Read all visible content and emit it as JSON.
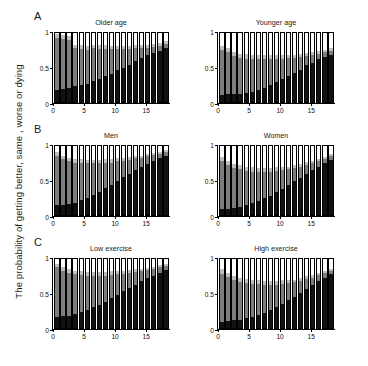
{
  "figure": {
    "ylabel": "The probability of getting better, same , worse or dying",
    "panels": [
      {
        "letter": "A",
        "left_title": "Older age",
        "right_title": "Younger age"
      },
      {
        "letter": "B",
        "left_title": "Men",
        "right_title": "Women"
      },
      {
        "letter": "C",
        "left_title": "Low exercise",
        "right_title": "High exercise"
      }
    ]
  },
  "colors": {
    "dying": "#111111",
    "worse": "#7d7d7d",
    "same": "#bfbfbf",
    "better": "#ffffff",
    "axis": "#000000",
    "background": "#ffffff"
  },
  "chart_data": [
    {
      "type": "bar",
      "title": "Older age",
      "panel": "A",
      "position": "left",
      "stacked": true,
      "xlabel": "",
      "ylabel": "The probability of getting better, same , worse or dying",
      "xlim": [
        0,
        19
      ],
      "ylim": [
        0,
        1
      ],
      "yticks": [
        0,
        0.5,
        1
      ],
      "ytick_labels": [
        "0",
        "0.5",
        "1"
      ],
      "xticks": [
        0,
        5,
        10,
        15
      ],
      "xtick_labels": [
        "0",
        "5",
        "10",
        "15"
      ],
      "grid": false,
      "legend": "none",
      "categories": [
        1,
        2,
        3,
        4,
        5,
        6,
        7,
        8,
        9,
        10,
        11,
        12,
        13,
        14,
        15,
        16,
        17,
        18,
        19
      ],
      "series": [
        {
          "name": "dying",
          "values": [
            0.18,
            0.19,
            0.2,
            0.23,
            0.25,
            0.26,
            0.3,
            0.33,
            0.37,
            0.41,
            0.46,
            0.5,
            0.53,
            0.6,
            0.64,
            0.68,
            0.71,
            0.74,
            0.78
          ]
        },
        {
          "name": "worse",
          "values": [
            0.75,
            0.73,
            0.7,
            0.55,
            0.52,
            0.5,
            0.48,
            0.44,
            0.4,
            0.36,
            0.31,
            0.27,
            0.24,
            0.18,
            0.14,
            0.11,
            0.09,
            0.07,
            0.06
          ]
        },
        {
          "name": "same",
          "values": [
            0.05,
            0.05,
            0.05,
            0.05,
            0.05,
            0.05,
            0.05,
            0.05,
            0.05,
            0.04,
            0.04,
            0.04,
            0.04,
            0.04,
            0.04,
            0.04,
            0.04,
            0.04,
            0.04
          ]
        },
        {
          "name": "better",
          "values": [
            0.02,
            0.03,
            0.05,
            0.17,
            0.18,
            0.19,
            0.17,
            0.18,
            0.18,
            0.19,
            0.19,
            0.19,
            0.19,
            0.18,
            0.18,
            0.17,
            0.16,
            0.15,
            0.12
          ]
        }
      ]
    },
    {
      "type": "bar",
      "title": "Younger age",
      "panel": "A",
      "position": "right",
      "stacked": true,
      "xlim": [
        0,
        19
      ],
      "ylim": [
        0,
        1
      ],
      "yticks": [
        0,
        0.5,
        1
      ],
      "ytick_labels": [
        "0",
        "0.5",
        "1"
      ],
      "xticks": [
        0,
        5,
        10,
        15
      ],
      "xtick_labels": [
        "0",
        "5",
        "10",
        "15"
      ],
      "grid": false,
      "legend": "none",
      "categories": [
        1,
        2,
        3,
        4,
        5,
        6,
        7,
        8,
        9,
        10,
        11,
        12,
        13,
        14,
        15,
        16,
        17,
        18,
        19
      ],
      "series": [
        {
          "name": "dying",
          "values": [
            0.1,
            0.11,
            0.12,
            0.12,
            0.13,
            0.15,
            0.18,
            0.21,
            0.25,
            0.29,
            0.33,
            0.38,
            0.42,
            0.47,
            0.53,
            0.57,
            0.62,
            0.65,
            0.68
          ]
        },
        {
          "name": "worse",
          "values": [
            0.66,
            0.62,
            0.55,
            0.52,
            0.5,
            0.48,
            0.45,
            0.42,
            0.38,
            0.34,
            0.3,
            0.26,
            0.22,
            0.18,
            0.14,
            0.11,
            0.08,
            0.07,
            0.06
          ]
        },
        {
          "name": "same",
          "values": [
            0.05,
            0.06,
            0.06,
            0.06,
            0.06,
            0.05,
            0.05,
            0.05,
            0.05,
            0.05,
            0.05,
            0.04,
            0.04,
            0.04,
            0.04,
            0.04,
            0.04,
            0.04,
            0.04
          ]
        },
        {
          "name": "better",
          "values": [
            0.19,
            0.21,
            0.27,
            0.3,
            0.31,
            0.32,
            0.32,
            0.32,
            0.32,
            0.32,
            0.32,
            0.32,
            0.32,
            0.31,
            0.29,
            0.28,
            0.26,
            0.24,
            0.22
          ]
        }
      ]
    },
    {
      "type": "bar",
      "title": "Men",
      "panel": "B",
      "position": "left",
      "stacked": true,
      "xlim": [
        0,
        19
      ],
      "ylim": [
        0,
        1
      ],
      "yticks": [
        0,
        0.5,
        1
      ],
      "ytick_labels": [
        "0",
        "0.5",
        "1"
      ],
      "xticks": [
        0,
        5,
        10,
        15
      ],
      "xtick_labels": [
        "0",
        "5",
        "10",
        "15"
      ],
      "grid": false,
      "legend": "none",
      "categories": [
        1,
        2,
        3,
        4,
        5,
        6,
        7,
        8,
        9,
        10,
        11,
        12,
        13,
        14,
        15,
        16,
        17,
        18,
        19
      ],
      "series": [
        {
          "name": "dying",
          "values": [
            0.14,
            0.15,
            0.16,
            0.18,
            0.22,
            0.25,
            0.29,
            0.34,
            0.39,
            0.44,
            0.5,
            0.55,
            0.6,
            0.65,
            0.7,
            0.74,
            0.78,
            0.82,
            0.86
          ]
        },
        {
          "name": "worse",
          "values": [
            0.72,
            0.66,
            0.62,
            0.58,
            0.54,
            0.5,
            0.46,
            0.41,
            0.37,
            0.32,
            0.28,
            0.24,
            0.2,
            0.17,
            0.13,
            0.11,
            0.09,
            0.07,
            0.05
          ]
        },
        {
          "name": "same",
          "values": [
            0.05,
            0.05,
            0.05,
            0.05,
            0.05,
            0.05,
            0.05,
            0.05,
            0.05,
            0.05,
            0.04,
            0.04,
            0.04,
            0.03,
            0.03,
            0.03,
            0.03,
            0.03,
            0.03
          ]
        },
        {
          "name": "better",
          "values": [
            0.09,
            0.14,
            0.17,
            0.19,
            0.19,
            0.2,
            0.2,
            0.2,
            0.19,
            0.19,
            0.18,
            0.17,
            0.16,
            0.15,
            0.14,
            0.12,
            0.1,
            0.08,
            0.06
          ]
        }
      ]
    },
    {
      "type": "bar",
      "title": "Women",
      "panel": "B",
      "position": "right",
      "stacked": true,
      "xlim": [
        0,
        19
      ],
      "ylim": [
        0,
        1
      ],
      "yticks": [
        0,
        0.5,
        1
      ],
      "ytick_labels": [
        "0",
        "0.5",
        "1"
      ],
      "xticks": [
        0,
        5,
        10,
        15
      ],
      "xtick_labels": [
        "0",
        "5",
        "10",
        "15"
      ],
      "grid": false,
      "legend": "none",
      "categories": [
        1,
        2,
        3,
        4,
        5,
        6,
        7,
        8,
        9,
        10,
        11,
        12,
        13,
        14,
        15,
        16,
        17,
        18,
        19
      ],
      "series": [
        {
          "name": "dying",
          "values": [
            0.08,
            0.09,
            0.1,
            0.12,
            0.14,
            0.17,
            0.2,
            0.24,
            0.28,
            0.33,
            0.38,
            0.43,
            0.49,
            0.54,
            0.6,
            0.65,
            0.7,
            0.75,
            0.8
          ]
        },
        {
          "name": "worse",
          "values": [
            0.7,
            0.63,
            0.58,
            0.54,
            0.5,
            0.46,
            0.43,
            0.39,
            0.35,
            0.31,
            0.27,
            0.23,
            0.19,
            0.16,
            0.13,
            0.1,
            0.08,
            0.06,
            0.05
          ]
        },
        {
          "name": "same",
          "values": [
            0.06,
            0.06,
            0.06,
            0.06,
            0.06,
            0.06,
            0.05,
            0.05,
            0.05,
            0.05,
            0.05,
            0.04,
            0.04,
            0.04,
            0.04,
            0.03,
            0.03,
            0.03,
            0.03
          ]
        },
        {
          "name": "better",
          "values": [
            0.16,
            0.22,
            0.26,
            0.28,
            0.3,
            0.31,
            0.32,
            0.32,
            0.32,
            0.31,
            0.3,
            0.3,
            0.28,
            0.26,
            0.23,
            0.22,
            0.19,
            0.16,
            0.12
          ]
        }
      ]
    },
    {
      "type": "bar",
      "title": "Low exercise",
      "panel": "C",
      "position": "left",
      "stacked": true,
      "xlim": [
        0,
        19
      ],
      "ylim": [
        0,
        1
      ],
      "yticks": [
        0,
        0.5,
        1
      ],
      "ytick_labels": [
        "0",
        "0.5",
        "1"
      ],
      "xticks": [
        0,
        5,
        10,
        15
      ],
      "xtick_labels": [
        "0",
        "5",
        "10",
        "15"
      ],
      "grid": false,
      "legend": "none",
      "categories": [
        1,
        2,
        3,
        4,
        5,
        6,
        7,
        8,
        9,
        10,
        11,
        12,
        13,
        14,
        15,
        16,
        17,
        18,
        19
      ],
      "series": [
        {
          "name": "dying",
          "values": [
            0.16,
            0.17,
            0.18,
            0.2,
            0.23,
            0.26,
            0.3,
            0.34,
            0.38,
            0.43,
            0.48,
            0.53,
            0.58,
            0.63,
            0.68,
            0.72,
            0.76,
            0.8,
            0.84
          ]
        },
        {
          "name": "worse",
          "values": [
            0.72,
            0.66,
            0.62,
            0.58,
            0.54,
            0.5,
            0.46,
            0.42,
            0.38,
            0.34,
            0.3,
            0.26,
            0.22,
            0.18,
            0.15,
            0.12,
            0.1,
            0.08,
            0.06
          ]
        },
        {
          "name": "same",
          "values": [
            0.05,
            0.05,
            0.05,
            0.05,
            0.05,
            0.05,
            0.05,
            0.05,
            0.05,
            0.05,
            0.04,
            0.04,
            0.04,
            0.04,
            0.03,
            0.03,
            0.03,
            0.03,
            0.03
          ]
        },
        {
          "name": "better",
          "values": [
            0.07,
            0.12,
            0.15,
            0.17,
            0.18,
            0.19,
            0.19,
            0.19,
            0.19,
            0.18,
            0.18,
            0.17,
            0.16,
            0.15,
            0.14,
            0.13,
            0.11,
            0.09,
            0.07
          ]
        }
      ]
    },
    {
      "type": "bar",
      "title": "High exercise",
      "panel": "C",
      "position": "right",
      "stacked": true,
      "xlim": [
        0,
        19
      ],
      "ylim": [
        0,
        1
      ],
      "yticks": [
        0,
        0.5,
        1
      ],
      "ytick_labels": [
        "0",
        "0.5",
        "1"
      ],
      "xticks": [
        0,
        5,
        10,
        15
      ],
      "xtick_labels": [
        "0",
        "5",
        "10",
        "15"
      ],
      "grid": false,
      "legend": "none",
      "categories": [
        1,
        2,
        3,
        4,
        5,
        6,
        7,
        8,
        9,
        10,
        11,
        12,
        13,
        14,
        15,
        16,
        17,
        18,
        19
      ],
      "series": [
        {
          "name": "dying",
          "values": [
            0.09,
            0.1,
            0.11,
            0.12,
            0.14,
            0.16,
            0.19,
            0.22,
            0.26,
            0.3,
            0.35,
            0.4,
            0.45,
            0.51,
            0.57,
            0.62,
            0.68,
            0.73,
            0.78
          ]
        },
        {
          "name": "worse",
          "values": [
            0.7,
            0.64,
            0.59,
            0.55,
            0.51,
            0.48,
            0.45,
            0.41,
            0.37,
            0.33,
            0.29,
            0.25,
            0.21,
            0.17,
            0.14,
            0.11,
            0.09,
            0.07,
            0.05
          ]
        },
        {
          "name": "same",
          "values": [
            0.06,
            0.06,
            0.06,
            0.06,
            0.06,
            0.06,
            0.05,
            0.05,
            0.05,
            0.05,
            0.05,
            0.05,
            0.04,
            0.04,
            0.04,
            0.04,
            0.03,
            0.03,
            0.03
          ]
        },
        {
          "name": "better",
          "values": [
            0.15,
            0.2,
            0.24,
            0.27,
            0.29,
            0.3,
            0.31,
            0.32,
            0.32,
            0.32,
            0.31,
            0.3,
            0.3,
            0.28,
            0.25,
            0.23,
            0.2,
            0.17,
            0.14
          ]
        }
      ]
    }
  ]
}
